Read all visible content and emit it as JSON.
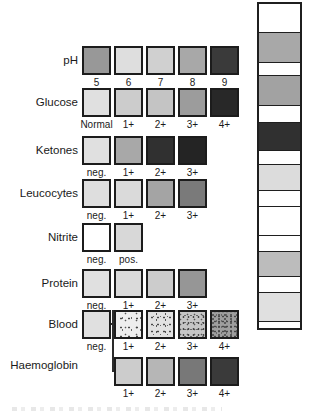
{
  "figure": {
    "background": "#ffffff",
    "border_color": "#1c1c1c"
  },
  "rows": [
    {
      "name": "ph",
      "label": "pH",
      "start_col": 0,
      "cells": [
        {
          "value": "5",
          "color": "#989898"
        },
        {
          "value": "6",
          "color": "#dedede"
        },
        {
          "value": "7",
          "color": "#d0d0d0"
        },
        {
          "value": "8",
          "color": "#a8a8a8"
        },
        {
          "value": "9",
          "color": "#3a3a3a"
        }
      ]
    },
    {
      "name": "glucose",
      "label": "Glucose",
      "start_col": 0,
      "cells": [
        {
          "value": "Normal",
          "color": "#e0e0e0"
        },
        {
          "value": "1+",
          "color": "#cccccc"
        },
        {
          "value": "2+",
          "color": "#c4c4c4"
        },
        {
          "value": "3+",
          "color": "#9c9c9c"
        },
        {
          "value": "4+",
          "color": "#282828"
        }
      ]
    },
    {
      "name": "ketones",
      "label": "Ketones",
      "start_col": 0,
      "cells": [
        {
          "value": "neg.",
          "color": "#e0e0e0"
        },
        {
          "value": "1+",
          "color": "#a8a8a8"
        },
        {
          "value": "2+",
          "color": "#303030"
        },
        {
          "value": "3+",
          "color": "#242424"
        }
      ]
    },
    {
      "name": "leucocytes",
      "label": "Leucocytes",
      "start_col": 0,
      "cells": [
        {
          "value": "neg.",
          "color": "#dedede"
        },
        {
          "value": "1+",
          "color": "#dadada"
        },
        {
          "value": "2+",
          "color": "#a4a4a4"
        },
        {
          "value": "3+",
          "color": "#7a7a7a"
        }
      ]
    },
    {
      "name": "nitrite",
      "label": "Nitrite",
      "start_col": 0,
      "cells": [
        {
          "value": "neg.",
          "color": "#ffffff"
        },
        {
          "value": "pos.",
          "color": "#d8d8d8"
        }
      ]
    },
    {
      "name": "protein",
      "label": "Protein",
      "start_col": 0,
      "cells": [
        {
          "value": "neg.",
          "color": "#e0e0e0"
        },
        {
          "value": "1+",
          "color": "#dadada"
        },
        {
          "value": "2+",
          "color": "#cccccc"
        },
        {
          "value": "3+",
          "color": "#969696"
        }
      ]
    },
    {
      "name": "blood",
      "label": "Blood",
      "start_col": 0,
      "cells": [
        {
          "value": "neg.",
          "color": "#e0e0e0"
        },
        {
          "value": "1+",
          "color": "#eeeeee",
          "speckle": 1
        },
        {
          "value": "2+",
          "color": "#e2e2e2",
          "speckle": 2
        },
        {
          "value": "3+",
          "color": "#c6c6c6",
          "speckle": 3
        },
        {
          "value": "4+",
          "color": "#9e9e9e",
          "speckle": 4
        }
      ]
    },
    {
      "name": "haemoglobin",
      "label": "Haemoglobin",
      "start_col": 1,
      "cells": [
        {
          "value": "1+",
          "color": "#cccccc"
        },
        {
          "value": "2+",
          "color": "#b6b6b6"
        },
        {
          "value": "3+",
          "color": "#787878"
        },
        {
          "value": "4+",
          "color": "#3a3a3a"
        }
      ]
    }
  ],
  "strip": {
    "bands": [
      {
        "type": "gap",
        "h": 28
      },
      {
        "type": "pad",
        "h": 31,
        "color": "#a8a8a8"
      },
      {
        "type": "gap",
        "h": 12
      },
      {
        "type": "pad",
        "h": 31,
        "color": "#a2a2a2"
      },
      {
        "type": "gap",
        "h": 16
      },
      {
        "type": "pad",
        "h": 29,
        "color": "#303030"
      },
      {
        "type": "gap",
        "h": 13
      },
      {
        "type": "pad",
        "h": 27,
        "color": "#dcdcdc"
      },
      {
        "type": "gap",
        "h": 15
      },
      {
        "type": "pad",
        "h": 30,
        "color": "#ffffff"
      },
      {
        "type": "gap",
        "h": 15
      },
      {
        "type": "pad",
        "h": 26,
        "color": "#bcbcbc"
      },
      {
        "type": "gap",
        "h": 15
      },
      {
        "type": "pad",
        "h": 30,
        "color": "#e0e0e0"
      },
      {
        "type": "gap",
        "h": 6
      }
    ]
  }
}
